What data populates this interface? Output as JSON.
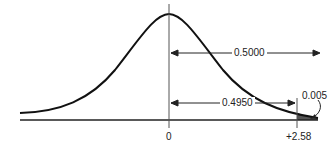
{
  "diagram": {
    "type": "normal-distribution",
    "title": "",
    "axis_ticks": [
      {
        "label": "0",
        "x": 0
      },
      {
        "label": "+2.58",
        "x": 2.58
      }
    ],
    "annotations": [
      {
        "label": "0.5000",
        "from": 0,
        "to": "infinity",
        "meaning": "area right of mean"
      },
      {
        "label": "0.4950",
        "from": 0,
        "to": 2.58,
        "meaning": "area between mean and z"
      },
      {
        "label": "0.005",
        "meaning": "shaded right tail beyond +2.58"
      }
    ],
    "colors": {
      "curve": "#111111",
      "shade": "#555555",
      "axis": "#222222"
    }
  }
}
